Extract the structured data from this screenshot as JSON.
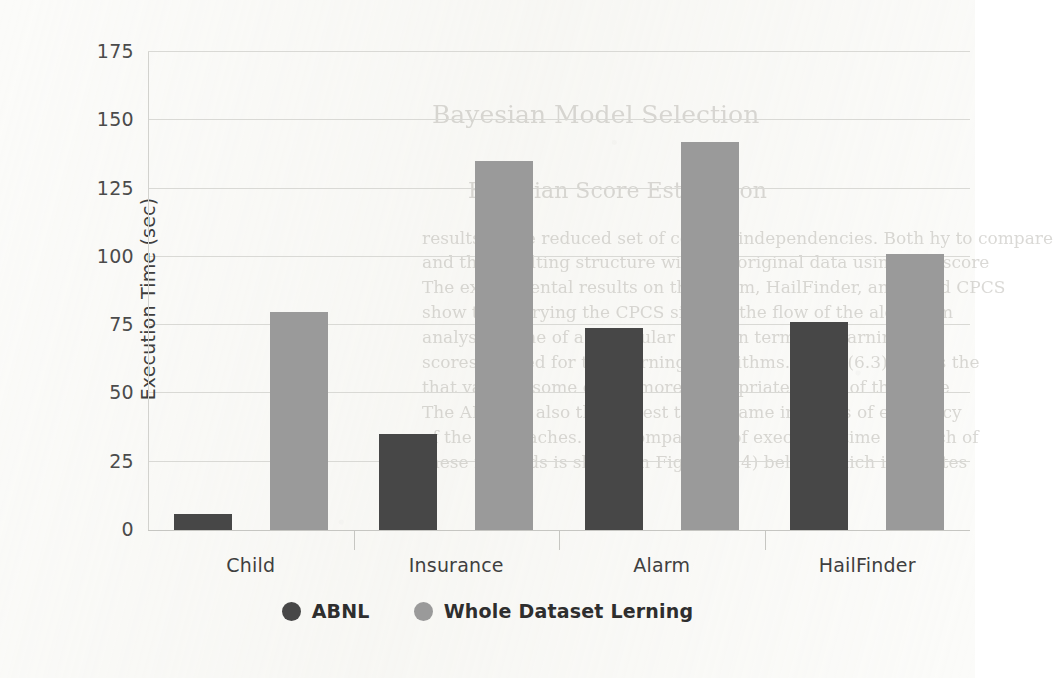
{
  "chart_data": {
    "type": "bar",
    "title": "",
    "subtitle": "",
    "xlabel": "",
    "ylabel": "Execution Time (sec)",
    "categories": [
      "Child",
      "Insurance",
      "Alarm",
      "HailFinder"
    ],
    "series": [
      {
        "name": "ABNL",
        "color": "#474747",
        "values": [
          6,
          35,
          74,
          76
        ]
      },
      {
        "name": "Whole Dataset Lerning",
        "color": "#9a9a9a",
        "values": [
          80,
          135,
          142,
          101
        ]
      }
    ],
    "ylim": [
      0,
      175
    ],
    "yticks": [
      0,
      25,
      50,
      75,
      100,
      125,
      150,
      175
    ],
    "ytick_labels": [
      "0",
      "25",
      "50",
      "75",
      "100",
      "125",
      "150",
      "175"
    ],
    "grid": "horizontal",
    "legend_position": "bottom",
    "grid_color": "#d9d9d5",
    "axis_color": "#c6c6c2",
    "background": "#fbfbf9"
  },
  "legend": {
    "items": [
      {
        "label": "ABNL",
        "marker": "filled-circle-dark"
      },
      {
        "label": "Whole Dataset Lerning",
        "marker": "filled-circle-grey"
      }
    ]
  },
  "scan_artifacts": {
    "ghost_lines": [
      "Bayesian Model Selection",
      "Bayesian Score Estimation",
      "results in the reduced set of correct independencies. Both  hy    to  compare",
      "and  the  resulting  structure  with  the  original  data  using  BIC  score",
      "The  experimental  results on  the  Alarm, HailFinder, and  Child  CPCS",
      "show  that  varying  the  CPCS  sizes  in  the  flow  of  the  algorithm",
      "analysis of the  of  a  particular  study  in  terms  of  learning",
      "scores  needed  for  the  learning  algorithms.  Table  (6.3)  shows  the",
      "that  varying  some  of  the  more  appropriate  CPCS  of  the  same",
      "The  ABNL  is  also  the  closest  to  the  same  in  terms  of  efficiency",
      "of  the  approaches.  The  comparison  of  execution  time  for  each  of",
      "these  methods  is  shown  in  Figure  (6.4)  below,  which  illustrates"
    ]
  }
}
